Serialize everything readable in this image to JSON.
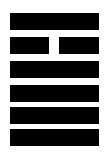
{
  "figure": {
    "kind": "i-ching-hexagram",
    "label": "Hexagram",
    "background_color": "#ffffff",
    "line_color": "#000000",
    "width_px": 106,
    "height_px": 156,
    "line_count": 6,
    "line_height_px": 17,
    "line_gap_px": 7,
    "first_line_top_px": 13,
    "bar_left_px": 10,
    "bar_right_px": 99,
    "break_gap_left_px": 49,
    "break_gap_width_px": 10,
    "lines_top_to_bottom": [
      {
        "index": 1,
        "position_from_top": 1,
        "position_from_bottom": 6,
        "type": "yang",
        "name": "solid-line",
        "top_px": 13,
        "broken": false
      },
      {
        "index": 2,
        "position_from_top": 2,
        "position_from_bottom": 5,
        "type": "yin",
        "name": "broken-line",
        "top_px": 37,
        "broken": true
      },
      {
        "index": 3,
        "position_from_top": 3,
        "position_from_bottom": 4,
        "type": "yang",
        "name": "solid-line",
        "top_px": 61,
        "broken": false
      },
      {
        "index": 4,
        "position_from_top": 4,
        "position_from_bottom": 3,
        "type": "yang",
        "name": "solid-line",
        "top_px": 85,
        "broken": false
      },
      {
        "index": 5,
        "position_from_top": 5,
        "position_from_bottom": 2,
        "type": "yang",
        "name": "solid-line",
        "top_px": 107,
        "broken": false
      },
      {
        "index": 6,
        "position_from_top": 6,
        "position_from_bottom": 1,
        "type": "yang",
        "name": "solid-line",
        "top_px": 129,
        "broken": false
      }
    ]
  }
}
